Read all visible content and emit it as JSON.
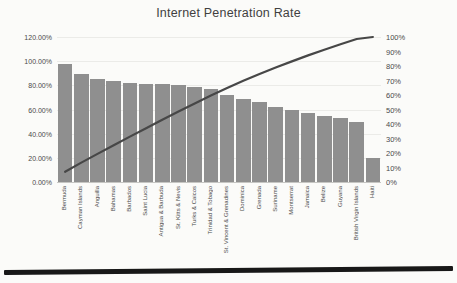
{
  "chart_data": {
    "type": "bar",
    "subtype": "pareto-combo",
    "title": "Internet Penetration Rate",
    "categories": [
      "Bermuda",
      "Cayman Islands",
      "Anguilla",
      "Bahamas",
      "Barbados",
      "Saint Lucia",
      "Antigua & Barbuda",
      "St. Kitts & Nevis",
      "Turks & Caicos",
      "Trinidad & Tobago",
      "St. Vincent & Grenadines",
      "Dominica",
      "Grenada",
      "Suriname",
      "Montserrat",
      "Jamaica",
      "Belize",
      "Guyana",
      "British Virgin Islands",
      "Haiti"
    ],
    "series": [
      {
        "name": "Internet penetration rate",
        "type": "bar",
        "axis": "left",
        "values": [
          98,
          89,
          85,
          84,
          82,
          81,
          81,
          80,
          79,
          77,
          72,
          69,
          66,
          62,
          60,
          57,
          55,
          53,
          50,
          20
        ]
      },
      {
        "name": "Cumulative share",
        "type": "line",
        "axis": "right",
        "values": [
          7,
          13.4,
          19.4,
          25.4,
          31.3,
          37.1,
          42.9,
          48.6,
          54.2,
          59.7,
          64.9,
          69.8,
          74.5,
          78.9,
          83.2,
          87.3,
          91.2,
          95,
          98.6,
          100
        ]
      }
    ],
    "left_axis": {
      "min": 0,
      "max": 120,
      "tick_labels": [
        "120.00%",
        "100.00%",
        "80.00%",
        "60.00%",
        "40.00%",
        "20.00%",
        "0.00%"
      ]
    },
    "right_axis": {
      "min": 0,
      "max": 100,
      "tick_labels": [
        "100%",
        "90%",
        "80%",
        "70%",
        "60%",
        "50%",
        "40%",
        "30%",
        "20%",
        "10%",
        "0%"
      ]
    },
    "legend": "none",
    "grid": "horizontal-faint",
    "colors": {
      "bar": "#8f8f8f",
      "line": "#474747",
      "text": "#3f3f3f",
      "grid": "#ebebe8",
      "axis": "#c6c6c3",
      "background": "#fbfbf9"
    }
  }
}
